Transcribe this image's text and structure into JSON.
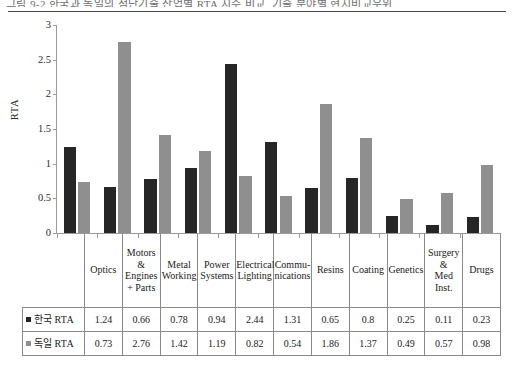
{
  "top_caption": {
    "text": "그림 9-2 한국과 독일의 첨단기술 산업별 RTA 지수 비교, 기술 분야별 현시비교우위"
  },
  "chart_data": {
    "type": "bar",
    "title": "",
    "xlabel": "",
    "ylabel": "RTA",
    "ylim": [
      0,
      3
    ],
    "yticks": [
      "0",
      "0.5",
      "1",
      "1.5",
      "2",
      "2.5",
      "3"
    ],
    "ytick_values": [
      0,
      0.5,
      1,
      1.5,
      2,
      2.5,
      3
    ],
    "grid": false,
    "legend_position": "table-row-headers",
    "categories": [
      "Optics",
      "Motors & Engines + Parts",
      "Metal Working",
      "Power Systems",
      "Electrical Lighting",
      "Communications",
      "Resins",
      "Coating",
      "Genetics",
      "Surgery & Med Inst.",
      "Drugs"
    ],
    "category_lines": [
      [
        "Optics"
      ],
      [
        "Motors",
        "&",
        "Engines",
        "+ Parts"
      ],
      [
        "Metal",
        "Working"
      ],
      [
        "Power",
        "Systems"
      ],
      [
        "Electrical",
        "Lighting"
      ],
      [
        "Commu-",
        "nications"
      ],
      [
        "Resins"
      ],
      [
        "Coating"
      ],
      [
        "Genetics"
      ],
      [
        "Surgery &",
        "Med Inst."
      ],
      [
        "Drugs"
      ]
    ],
    "series": [
      {
        "name": "한국 RTA",
        "label_main": "한국",
        "label_suffix": "RTA",
        "color": "#262626",
        "values": [
          1.24,
          0.66,
          0.78,
          0.94,
          2.44,
          1.31,
          0.65,
          0.8,
          0.25,
          0.11,
          0.23
        ],
        "value_labels": [
          "1.24",
          "0.66",
          "0.78",
          "0.94",
          "2.44",
          "1.31",
          "0.65",
          "0.8",
          "0.25",
          "0.11",
          "0.23"
        ]
      },
      {
        "name": "독일 RTA",
        "label_main": "독일",
        "label_suffix": "RTA",
        "color": "#8f8f8f",
        "values": [
          0.73,
          2.76,
          1.42,
          1.19,
          0.82,
          0.54,
          1.86,
          1.37,
          0.49,
          0.57,
          0.98
        ],
        "value_labels": [
          "0.73",
          "2.76",
          "1.42",
          "1.19",
          "0.82",
          "0.54",
          "1.86",
          "1.37",
          "0.49",
          "0.57",
          "0.98"
        ]
      }
    ]
  },
  "colors": {
    "series_korea": "#262626",
    "series_germany": "#8f8f8f",
    "axis": "#9a9a9a",
    "grid_border": "#8a8a8a",
    "text": "#1a1a1a"
  }
}
